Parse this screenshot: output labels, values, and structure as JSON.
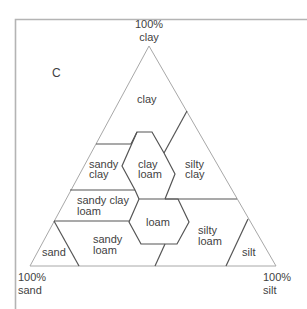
{
  "panel_label": "C",
  "vertices": {
    "top": {
      "pct": "100%",
      "name": "clay"
    },
    "left": {
      "pct": "100%",
      "name": "sand"
    },
    "right": {
      "pct": "100%",
      "name": "silt"
    }
  },
  "regions": [
    {
      "id": "clay",
      "lines": [
        "clay"
      ]
    },
    {
      "id": "sandy-clay",
      "lines": [
        "sandy",
        "clay"
      ]
    },
    {
      "id": "clay-loam",
      "lines": [
        "clay",
        "loam"
      ]
    },
    {
      "id": "silty-clay",
      "lines": [
        "silty",
        "clay"
      ]
    },
    {
      "id": "sandy-clay-loam",
      "lines": [
        "sandy clay",
        "loam"
      ]
    },
    {
      "id": "loam",
      "lines": [
        "loam"
      ]
    },
    {
      "id": "silty-loam",
      "lines": [
        "silty",
        "loam"
      ]
    },
    {
      "id": "sand",
      "lines": [
        "sand"
      ]
    },
    {
      "id": "sandy-loam",
      "lines": [
        "sandy",
        "loam"
      ]
    },
    {
      "id": "silt",
      "lines": [
        "silt"
      ]
    }
  ]
}
